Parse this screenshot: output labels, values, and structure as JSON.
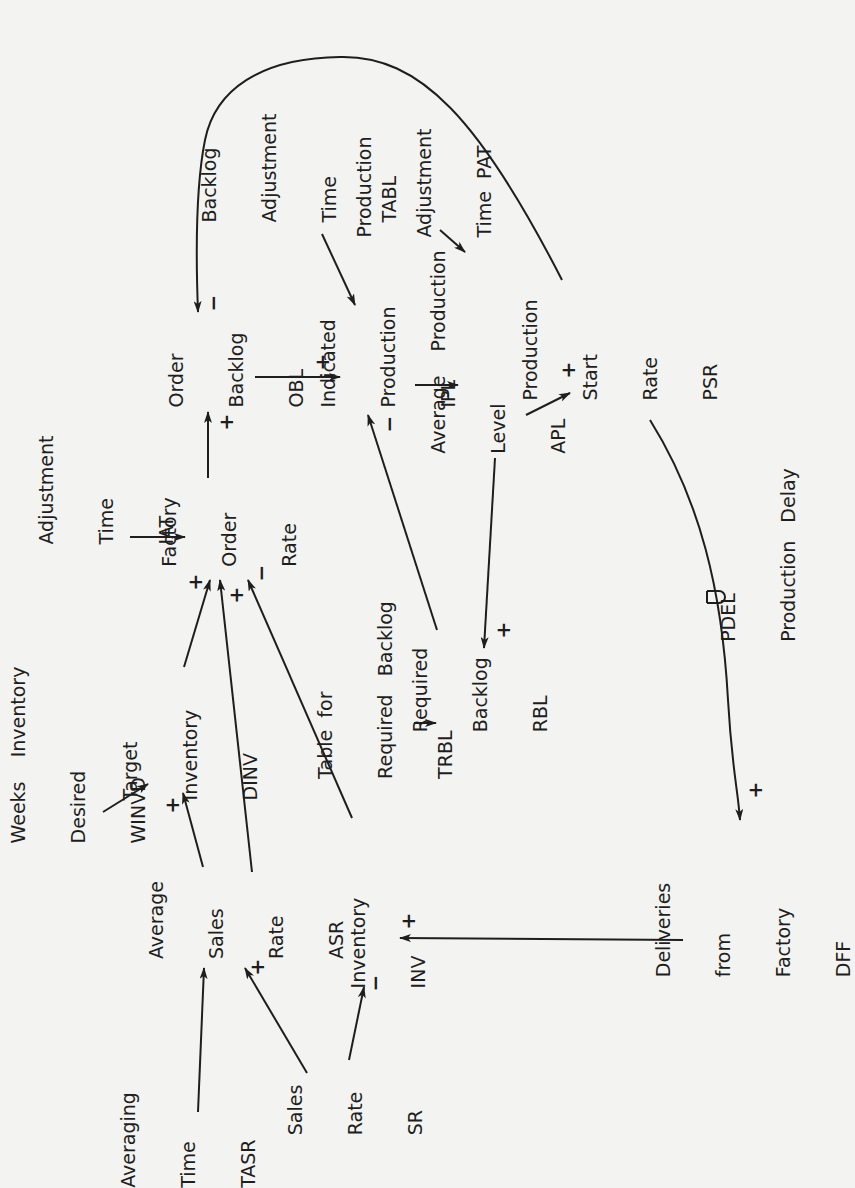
{
  "diagram": {
    "orientation": "rotated 90 degrees counter-clockwise",
    "nodes": {
      "tasr": {
        "lines": [
          "Averaging",
          "Time",
          "TASR"
        ]
      },
      "sr": {
        "lines": [
          "Sales",
          "Rate",
          "SR"
        ]
      },
      "asr": {
        "lines": [
          "Average",
          "Sales",
          "Rate",
          "ASR"
        ]
      },
      "inv": {
        "lines": [
          "Inventory",
          "INV"
        ]
      },
      "dff": {
        "lines": [
          "Deliveries",
          "from",
          "Factory",
          "DFF"
        ]
      },
      "winvd": {
        "lines": [
          "Weeks    Inventory",
          "Desired",
          "WINVD"
        ]
      },
      "dinv": {
        "lines": [
          "Target",
          "Inventory",
          "DINV"
        ]
      },
      "iat": {
        "lines": [
          "Inventory",
          "Adjustment",
          "Time",
          "IAT"
        ]
      },
      "for": {
        "lines": [
          "Factory",
          "Order",
          "Rate"
        ]
      },
      "obl": {
        "lines": [
          "Order",
          "Backlog",
          "OBL"
        ]
      },
      "trbl": {
        "lines": [
          "Table  for",
          "Required   Backlog",
          "TRBL"
        ]
      },
      "rbl": {
        "lines": [
          "Required",
          "Backlog",
          "RBL"
        ]
      },
      "ipl": {
        "lines": [
          "Indicated",
          "Production",
          "IPL"
        ]
      },
      "apl": {
        "lines": [
          "Average    Production",
          "Level",
          "APL"
        ]
      },
      "psr": {
        "lines": [
          "Production",
          "Start",
          "Rate",
          "PSR"
        ]
      },
      "tabl": {
        "lines": [
          "Backlog",
          "Adjustment",
          "Time",
          "TABL"
        ]
      },
      "pat": {
        "lines": [
          "Production",
          "Adjustment",
          "Time  PAT"
        ]
      },
      "pdel": {
        "lines": [
          "PDEL",
          "Production   Delay"
        ]
      }
    },
    "delay_symbol": "D",
    "links": [
      {
        "from": "TASR",
        "to": "ASR",
        "sign": ""
      },
      {
        "from": "SR",
        "to": "ASR",
        "sign": "+"
      },
      {
        "from": "SR",
        "to": "INV",
        "sign": "−"
      },
      {
        "from": "DFF",
        "to": "INV",
        "sign": "+"
      },
      {
        "from": "ASR",
        "to": "DINV",
        "sign": "+"
      },
      {
        "from": "WINVD",
        "to": "DINV",
        "sign": ""
      },
      {
        "from": "DINV",
        "to": "Factory Order Rate",
        "sign": "+"
      },
      {
        "from": "ASR",
        "to": "Factory Order Rate",
        "sign": "+"
      },
      {
        "from": "INV",
        "to": "Factory Order Rate",
        "sign": "−"
      },
      {
        "from": "IAT",
        "to": "Factory Order Rate",
        "sign": ""
      },
      {
        "from": "Factory Order Rate",
        "to": "OBL",
        "sign": "+"
      },
      {
        "from": "OBL",
        "to": "IPL",
        "sign": "+"
      },
      {
        "from": "TABL",
        "to": "IPL",
        "sign": ""
      },
      {
        "from": "RBL",
        "to": "IPL",
        "sign": "−"
      },
      {
        "from": "TRBL",
        "to": "RBL",
        "sign": ""
      },
      {
        "from": "APL",
        "to": "RBL",
        "sign": "+"
      },
      {
        "from": "IPL",
        "to": "APL",
        "sign": ""
      },
      {
        "from": "PAT",
        "to": "APL",
        "sign": ""
      },
      {
        "from": "APL",
        "to": "PSR",
        "sign": "+"
      },
      {
        "from": "PSR",
        "to": "OBL",
        "sign": "−"
      },
      {
        "from": "PSR",
        "to": "DFF",
        "sign": "+",
        "delay": "PDEL"
      }
    ],
    "signs": {
      "plus": "+",
      "minus": "−"
    }
  }
}
